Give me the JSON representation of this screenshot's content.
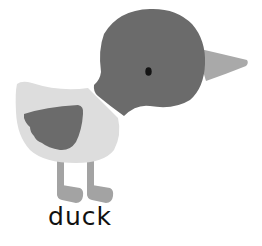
{
  "card": {
    "caption": "duck",
    "illustration": "duck-illustration"
  },
  "colors": {
    "background": "#ffffff",
    "head": "#6b6b6b",
    "beak": "#a9a9a9",
    "eye": "#141414",
    "body": "#dddddd",
    "wing": "#6b6b6b",
    "legs": "#a3a3a3",
    "caption": "#111111"
  }
}
